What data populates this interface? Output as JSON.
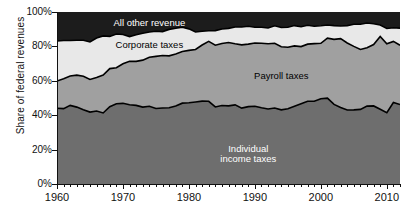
{
  "chart_data": {
    "type": "area",
    "stacked": true,
    "title": "",
    "xlabel": "",
    "ylabel": "Share of federal revenues",
    "xlim": [
      1960,
      2012
    ],
    "ylim": [
      0,
      100
    ],
    "yticks": [
      "0%",
      "20%",
      "40%",
      "60%",
      "80%",
      "100%"
    ],
    "ytick_values": [
      0,
      20,
      40,
      60,
      80,
      100
    ],
    "xticks": [
      "1960",
      "1970",
      "1980",
      "1990",
      "2000",
      "2010"
    ],
    "xtick_values": [
      1960,
      1970,
      1980,
      1990,
      2000,
      2010
    ],
    "grid": false,
    "legend": "inline-labels",
    "x": [
      1960,
      1961,
      1962,
      1963,
      1964,
      1965,
      1966,
      1967,
      1968,
      1969,
      1970,
      1971,
      1972,
      1973,
      1974,
      1975,
      1976,
      1977,
      1978,
      1979,
      1980,
      1981,
      1982,
      1983,
      1984,
      1985,
      1986,
      1987,
      1988,
      1989,
      1990,
      1991,
      1992,
      1993,
      1994,
      1995,
      1996,
      1997,
      1998,
      1999,
      2000,
      2001,
      2002,
      2003,
      2004,
      2005,
      2006,
      2007,
      2008,
      2009,
      2010,
      2011,
      2012
    ],
    "series": [
      {
        "name": "Individual income taxes",
        "color": "#6e6e6e",
        "label_color": "#ffffff",
        "values": [
          44.0,
          43.8,
          45.7,
          44.7,
          43.2,
          41.8,
          42.4,
          41.3,
          44.9,
          46.7,
          46.9,
          46.1,
          45.7,
          44.7,
          45.2,
          43.9,
          44.2,
          44.3,
          45.3,
          47.0,
          47.2,
          47.7,
          48.2,
          48.1,
          44.8,
          45.6,
          45.4,
          46.0,
          44.1,
          45.0,
          45.2,
          44.3,
          43.6,
          44.2,
          43.1,
          43.7,
          45.2,
          46.7,
          48.1,
          48.1,
          49.6,
          49.9,
          46.3,
          44.5,
          43.0,
          43.1,
          43.4,
          45.3,
          45.4,
          43.5,
          41.5,
          47.4,
          46.2
        ]
      },
      {
        "name": "Payroll taxes",
        "color": "#a0a0a0",
        "label_color": "#000000",
        "values": [
          15.9,
          17.4,
          17.1,
          18.6,
          19.5,
          19.0,
          19.5,
          22.0,
          22.2,
          20.9,
          23.0,
          25.3,
          25.6,
          27.3,
          28.5,
          30.3,
          30.5,
          30.2,
          30.3,
          30.0,
          30.5,
          30.5,
          32.6,
          34.8,
          35.9,
          36.1,
          36.9,
          35.5,
          36.8,
          36.3,
          36.8,
          37.5,
          37.9,
          37.6,
          36.7,
          35.8,
          35.1,
          33.2,
          33.2,
          33.5,
          32.2,
          34.9,
          37.8,
          40.0,
          39.0,
          36.9,
          34.8,
          33.9,
          35.7,
          42.3,
          40.0,
          35.5,
          34.5
        ]
      },
      {
        "name": "Corporate taxes",
        "color": "#e8e8e8",
        "label_color": "#000000",
        "values": [
          23.2,
          22.2,
          20.6,
          20.3,
          20.9,
          21.8,
          23.0,
          22.8,
          18.7,
          19.6,
          17.0,
          14.3,
          15.5,
          15.7,
          14.7,
          14.6,
          13.9,
          15.4,
          15.0,
          14.2,
          12.5,
          10.2,
          8.0,
          6.2,
          8.5,
          8.4,
          8.2,
          9.8,
          10.4,
          10.4,
          9.1,
          9.3,
          9.2,
          10.2,
          11.2,
          11.6,
          11.8,
          11.5,
          11.0,
          10.1,
          10.2,
          7.6,
          8.0,
          7.4,
          10.1,
          12.9,
          14.7,
          14.4,
          12.1,
          6.6,
          8.9,
          7.9,
          9.9
        ]
      },
      {
        "name": "All other revenue",
        "color": "#1c1c1c",
        "label_color": "#ffffff",
        "values": [
          16.9,
          16.6,
          16.6,
          16.4,
          16.4,
          17.4,
          15.1,
          13.9,
          14.2,
          12.8,
          13.1,
          14.3,
          13.2,
          12.3,
          11.6,
          11.2,
          11.4,
          10.1,
          9.4,
          8.8,
          9.8,
          11.6,
          11.2,
          10.9,
          10.8,
          9.9,
          9.5,
          8.7,
          8.7,
          8.3,
          8.9,
          8.9,
          9.3,
          8.0,
          9.0,
          8.9,
          7.9,
          8.6,
          7.7,
          8.3,
          8.0,
          7.6,
          7.9,
          8.1,
          7.9,
          7.1,
          7.1,
          6.4,
          6.8,
          7.6,
          9.6,
          9.2,
          9.4
        ]
      }
    ],
    "annotations": [
      {
        "text": "All other revenue",
        "x": 1974,
        "y": 93,
        "color": "#ffffff"
      },
      {
        "text": "Corporate taxes",
        "x": 1974,
        "y": 80.5,
        "color": "#000000"
      },
      {
        "text": "Payroll taxes",
        "x": 1994,
        "y": 62,
        "color": "#000000"
      },
      {
        "text": "Individual\nincome taxes",
        "x": 1989,
        "y": 20,
        "color": "#ffffff"
      }
    ]
  },
  "axis": {
    "ylabel": "Share of federal revenues",
    "yticks": [
      "100%",
      "80%",
      "60%",
      "40%",
      "20%",
      "0%"
    ],
    "xticks": [
      "1960",
      "1970",
      "1980",
      "1990",
      "2000",
      "2010"
    ]
  },
  "labels": {
    "all_other": "All other revenue",
    "corporate": "Corporate taxes",
    "payroll": "Payroll taxes",
    "individual_line1": "Individual",
    "individual_line2": "income taxes"
  },
  "colors": {
    "all_other": "#1c1c1c",
    "corporate": "#e8e8e8",
    "payroll": "#a0a0a0",
    "individual": "#6e6e6e",
    "outline": "#000000",
    "background": "#ffffff"
  }
}
